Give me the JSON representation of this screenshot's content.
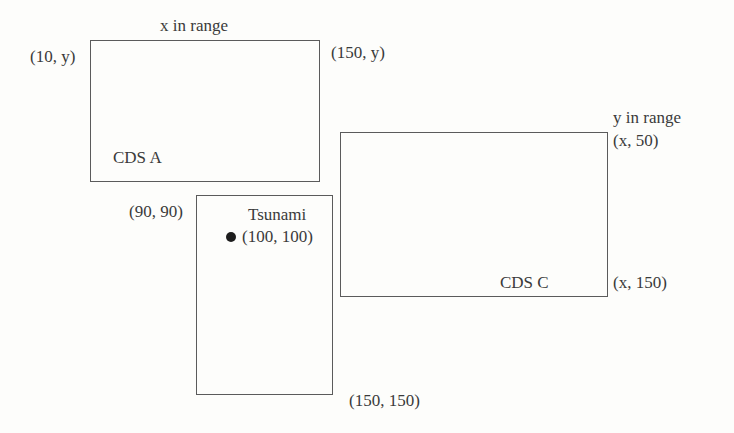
{
  "diagram": {
    "background_color": "#fdfdfb",
    "stroke_color": "#5b5b5b",
    "text_color": "#3a3a3a",
    "marker_color": "#1d1d1d"
  },
  "boxes": [
    {
      "id": "cds-a",
      "label": "CDS A",
      "range_label": "x in range",
      "top_left_label": "(10, y)",
      "top_right_label": "(150, y)"
    },
    {
      "id": "tsunami",
      "label": "Tsunami",
      "top_left_label": "(90, 90)",
      "bottom_right_label": "(150, 150)",
      "point_label": "(100, 100)"
    },
    {
      "id": "cds-c",
      "label": "CDS C",
      "range_label": "y in range",
      "top_right_label": "(x, 50)",
      "bottom_right_label": "(x, 150)"
    }
  ],
  "labels": {
    "x_in_range": "x in range",
    "y_in_range": "y in range",
    "corner_10_y": "(10, y)",
    "corner_150_y": "(150, y)",
    "corner_90_90": "(90, 90)",
    "corner_150_150": "(150, 150)",
    "corner_x_50": "(x, 50)",
    "corner_x_150": "(x, 150)",
    "cds_a": "CDS A",
    "cds_c": "CDS C",
    "tsunami": "Tsunami",
    "point_100_100": "(100, 100)"
  }
}
